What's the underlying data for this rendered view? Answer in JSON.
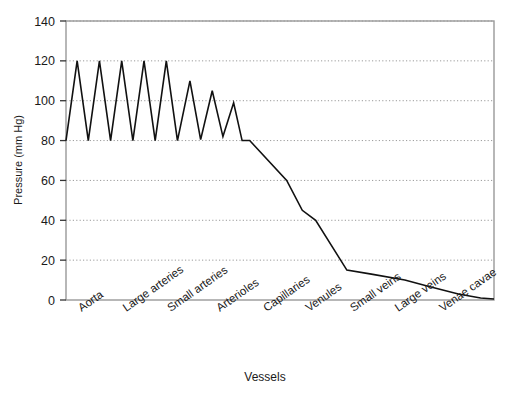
{
  "chart_data": {
    "type": "line",
    "title": "",
    "xlabel": "Vessels",
    "ylabel": "Pressure (mm Hg)",
    "ylim": [
      0,
      140
    ],
    "ytick_values": [
      0,
      20,
      40,
      60,
      80,
      100,
      120,
      140
    ],
    "ytick_labels": [
      "0",
      "20",
      "40",
      "60",
      "80",
      "100",
      "120",
      "140"
    ],
    "grid": "horizontal-dotted",
    "legend": "none",
    "categories": [
      "Aorta",
      "Large arteries",
      "Small arteries",
      "Arterioles",
      "Capillaries",
      "Venules",
      "Small veins",
      "Large veins",
      "Venae cavae"
    ],
    "category_x_positions": [
      0.35,
      1.35,
      2.35,
      3.45,
      4.5,
      5.45,
      6.45,
      7.45,
      8.45
    ],
    "xlim": [
      0,
      9.6
    ],
    "series": [
      {
        "name": "Blood pressure",
        "description": "Pulsatile systolic/diastolic oscillation in aorta and arteries damping to steady flow, then falling across arterioles, capillaries and veins to near zero at the venae cavae.",
        "points": [
          [
            0.0,
            80
          ],
          [
            0.25,
            120
          ],
          [
            0.5,
            80
          ],
          [
            0.75,
            120
          ],
          [
            1.0,
            80
          ],
          [
            1.25,
            120
          ],
          [
            1.5,
            80
          ],
          [
            1.75,
            120
          ],
          [
            2.0,
            80
          ],
          [
            2.25,
            120
          ],
          [
            2.5,
            80
          ],
          [
            2.78,
            110
          ],
          [
            3.02,
            80.5
          ],
          [
            3.28,
            105
          ],
          [
            3.52,
            82
          ],
          [
            3.76,
            99
          ],
          [
            3.95,
            80
          ],
          [
            4.12,
            80
          ],
          [
            4.95,
            60
          ],
          [
            5.3,
            45
          ],
          [
            5.6,
            40
          ],
          [
            6.3,
            15
          ],
          [
            6.85,
            13
          ],
          [
            7.6,
            10
          ],
          [
            8.1,
            7
          ],
          [
            8.8,
            3
          ],
          [
            9.3,
            1
          ],
          [
            9.6,
            0.5
          ]
        ]
      }
    ],
    "annotations": []
  },
  "style": {
    "line_color": "#111111",
    "frame_color": "#999999",
    "grid_color": "#9a9a9a",
    "background": "#ffffff",
    "text_color": "#1a1a1a"
  }
}
